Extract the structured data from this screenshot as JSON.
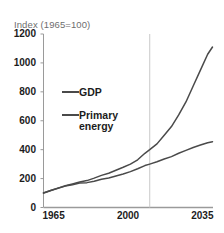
{
  "chart_data": {
    "type": "line",
    "title": "",
    "subtitle": "Index (1965=100)",
    "xlabel": "",
    "ylabel": "",
    "xlim": [
      1965,
      2035
    ],
    "ylim": [
      0,
      1200
    ],
    "xticks": [
      "1965",
      "2000",
      "2035"
    ],
    "xtick_values": [
      1965,
      2000,
      2035
    ],
    "yticks": [
      "0",
      "200",
      "400",
      "600",
      "800",
      "1000",
      "1200"
    ],
    "ytick_values": [
      0,
      200,
      400,
      600,
      800,
      1000,
      1200
    ],
    "grid": false,
    "legend_position": "inside-left",
    "annotations": [
      {
        "name": "projection-divider",
        "type": "vline",
        "x": 2009,
        "color": "#c9c9c9"
      }
    ],
    "x": [
      1965,
      1968,
      1971,
      1974,
      1977,
      1980,
      1983,
      1986,
      1989,
      1992,
      1995,
      1998,
      2001,
      2004,
      2007,
      2009,
      2012,
      2015,
      2018,
      2021,
      2024,
      2027,
      2030,
      2033,
      2035
    ],
    "series": [
      {
        "name": "GDP",
        "color": "#4a4a4a",
        "values": [
          100,
          118,
          134,
          150,
          163,
          176,
          186,
          203,
          222,
          237,
          258,
          278,
          300,
          330,
          375,
          400,
          440,
          500,
          560,
          640,
          730,
          840,
          950,
          1060,
          1110
        ]
      },
      {
        "name": "Primary energy",
        "color": "#4a4a4a",
        "values": [
          100,
          117,
          133,
          148,
          158,
          170,
          172,
          182,
          196,
          204,
          218,
          232,
          248,
          268,
          290,
          300,
          316,
          335,
          352,
          375,
          395,
          415,
          432,
          448,
          455
        ]
      }
    ]
  },
  "legend": {
    "gdp_label": "GDP",
    "energy_label_line1": "Primary",
    "energy_label_line2": "energy"
  },
  "colors": {
    "line": "#4a4a4a",
    "axis": "#9a9a9a",
    "divider": "#c9c9c9",
    "tick_text": "#1c1c1c",
    "subtitle_text": "#6e6e6e"
  }
}
